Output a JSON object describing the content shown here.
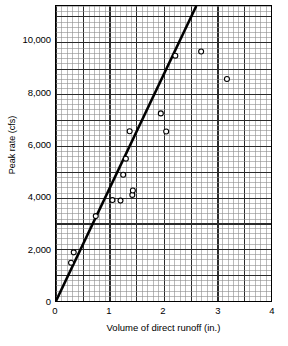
{
  "chart_data": {
    "type": "scatter",
    "title": "",
    "xlabel": "Volume of direct runoff (in.)",
    "ylabel": "Peak rate (cfs)",
    "xlim": [
      0,
      4
    ],
    "ylim": [
      0,
      11400
    ],
    "xticks": [
      0,
      1,
      2,
      3,
      4
    ],
    "xtick_labels": [
      "0",
      "1",
      "2",
      "3",
      "4"
    ],
    "yticks": [
      0,
      2000,
      4000,
      6000,
      8000,
      10000
    ],
    "ytick_labels": [
      "0",
      "2,000",
      "4,000",
      "6,000",
      "8,000",
      "10,000"
    ],
    "grid": true,
    "grid_minor_x_step": 0.1,
    "grid_minor_y_step": 200,
    "grid_major_x_step": 0.5,
    "grid_major_y_step": 1000,
    "legend": null,
    "marker": "open-circle",
    "points": [
      {
        "x": 0.28,
        "y": 1480
      },
      {
        "x": 0.33,
        "y": 1880
      },
      {
        "x": 0.74,
        "y": 3280
      },
      {
        "x": 1.05,
        "y": 3900
      },
      {
        "x": 1.2,
        "y": 3880
      },
      {
        "x": 1.25,
        "y": 4880
      },
      {
        "x": 1.3,
        "y": 5500
      },
      {
        "x": 1.37,
        "y": 6560
      },
      {
        "x": 1.42,
        "y": 4100
      },
      {
        "x": 1.43,
        "y": 4270
      },
      {
        "x": 1.95,
        "y": 7250
      },
      {
        "x": 2.05,
        "y": 6550
      },
      {
        "x": 2.22,
        "y": 9480
      },
      {
        "x": 2.7,
        "y": 9640
      },
      {
        "x": 3.18,
        "y": 8580
      }
    ],
    "trend_line": {
      "type": "line",
      "through_origin": true,
      "x_start": 0,
      "y_start": 0,
      "x_end": 2.61,
      "y_end": 11400,
      "slope": 4368
    },
    "colors": {
      "axis": "#000000",
      "grid_minor": "#8d8d8d",
      "grid_major": "#2b2b2b",
      "marker_edge": "#000000",
      "marker_face": "#ffffff",
      "trend_line": "#000000",
      "background": "#ffffff"
    }
  }
}
